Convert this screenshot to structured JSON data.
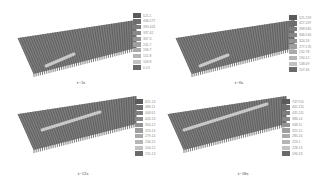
{
  "figure": {
    "panels": [
      {
        "caption": "t=3s",
        "legend": [
          "521.1",
          "436.577",
          "390.423",
          "337.42",
          "307.3",
          "241.7",
          "196.7",
          "151.8",
          "109.8",
          "0.13"
        ],
        "hot_band": {
          "x1": 34,
          "y1": 56,
          "x2": 62,
          "y2": 44
        }
      },
      {
        "caption": "t=6s",
        "legend": [
          "521.219",
          "457.237",
          "398.945",
          "366.516",
          "324.18",
          "277.176",
          "232.78",
          "190.12",
          "148.09",
          "107.46"
        ],
        "hot_band": {
          "x1": 30,
          "y1": 56,
          "x2": 58,
          "y2": 45
        }
      },
      {
        "caption": "t=12s",
        "legend": [
          "621.13",
          "483.11",
          "444.61",
          "420.13",
          "354.12",
          "313.13",
          "279.14",
          "234.12",
          "204.12",
          "151.13"
        ],
        "hot_band": {
          "x1": 30,
          "y1": 44,
          "x2": 88,
          "y2": 26
        }
      },
      {
        "caption": "t=18s",
        "legend": [
          "747.911",
          "461.211",
          "431.111",
          "386.14",
          "348.11",
          "325.15",
          "285.16",
          "253.1",
          "228.13",
          "196.23"
        ],
        "hot_band": {
          "x1": 22,
          "y1": 44,
          "x2": 105,
          "y2": 18
        }
      }
    ],
    "colors": {
      "legend_swatches": [
        "#5a5a5a",
        "#6e6e6e",
        "#7c7c7c",
        "#888888",
        "#939393",
        "#9e9e9e",
        "#aaaaaa",
        "#b5b5b5",
        "#c2c2c2",
        "#6a6a6a"
      ],
      "plate": "#7d7d7d",
      "fin_dark": "#5c5c5c",
      "hot_band": "#d8d8d8"
    }
  }
}
